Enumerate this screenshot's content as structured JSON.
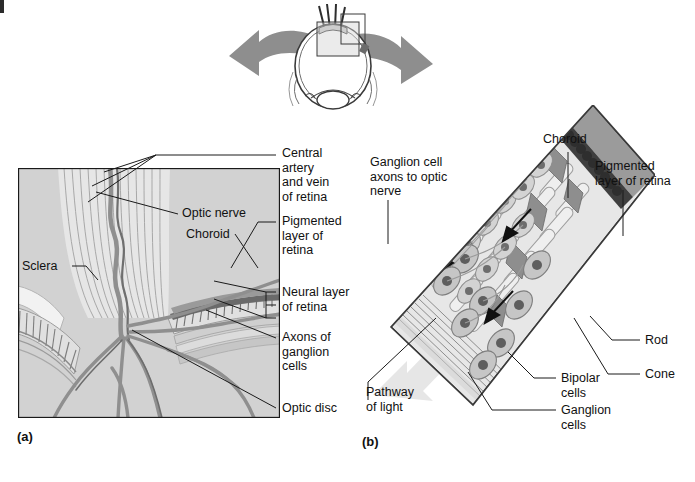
{
  "figure": {
    "panels": [
      {
        "id": "a",
        "letter": "(a)",
        "caption": "Cross section through the optic disc and posterior eye wall"
      },
      {
        "id": "b",
        "letter": "(b)",
        "caption": "Cellular organization of the neural retina"
      }
    ]
  },
  "orientation_inset": {
    "name": "eye-cross-section-inset",
    "left_arrow": "arrow-to-panel-a",
    "right_arrow": "arrow-to-panel-b",
    "callout_box": "retina-region-box"
  },
  "panel_a": {
    "letter": "(a)",
    "labels": [
      {
        "key": "central_artery_vein",
        "text": "Central\nartery\nand vein\nof retina"
      },
      {
        "key": "optic_nerve",
        "text": "Optic nerve"
      },
      {
        "key": "choroid",
        "text": "Choroid"
      },
      {
        "key": "pigmented_layer",
        "text": "Pigmented\nlayer of\nretina"
      },
      {
        "key": "neural_layer",
        "text": "Neural layer\nof retina"
      },
      {
        "key": "sclera",
        "text": "Sclera"
      },
      {
        "key": "axons_ganglion",
        "text": "Axons of\nganglion\ncells"
      },
      {
        "key": "optic_disc",
        "text": "Optic disc"
      }
    ]
  },
  "panel_b": {
    "letter": "(b)",
    "labels": [
      {
        "key": "ganglion_axons",
        "text": "Ganglion cell\naxons to optic\nnerve"
      },
      {
        "key": "choroid",
        "text": "Choroid"
      },
      {
        "key": "pigmented_layer",
        "text": "Pigmented\nlayer of retina"
      },
      {
        "key": "rod",
        "text": "Rod"
      },
      {
        "key": "cone",
        "text": "Cone"
      },
      {
        "key": "bipolar_cells",
        "text": "Bipolar\ncells"
      },
      {
        "key": "ganglion_cells",
        "text": "Ganglion\ncells"
      },
      {
        "key": "pathway_of_light",
        "text": "Pathway\nof light"
      }
    ],
    "direction_arrows": 4
  },
  "colors": {
    "ink": "#1a1a1a",
    "panel_fill": "#d6d6d6",
    "vessel": "#8c8c8c",
    "choroid_band": "#8a8a8a",
    "pigment_band": "#3d3d3d",
    "tissue_light": "#e3e3e3",
    "tissue_mid": "#bdbdbd",
    "arrow_grey": "#9a9a9a",
    "light_beam": "#ececec"
  }
}
